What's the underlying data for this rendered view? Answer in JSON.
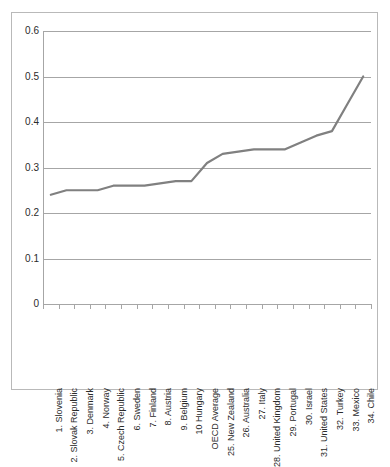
{
  "chart_data": {
    "type": "line",
    "title": "",
    "subtitle": "",
    "xlabel": "",
    "ylabel": "",
    "ylim": [
      0,
      0.6
    ],
    "y_ticks": [
      0,
      0.1,
      0.2,
      0.3,
      0.4,
      0.5,
      0.6
    ],
    "y_tick_labels": [
      "0",
      "0.1",
      "0.2",
      "0.3",
      "0.4",
      "0.5",
      "0.6"
    ],
    "grid": true,
    "legend": false,
    "legend_position": "none",
    "line_color": "#808080",
    "gridline_color": "#a6a6a6",
    "background_color": "#ffffff",
    "border_color": "#b9b9b9",
    "categories": [
      "1. Slovenia",
      "2. Slovak Republic",
      "3. Denmark",
      "4. Norway",
      "5. Czech Republic",
      "6. Sweden",
      "7. Finland",
      "8. Austria",
      "9. Belgium",
      "10 Hungary",
      "OECD Average",
      "25. New Zealand",
      "26. Australia",
      "27. Italy",
      "28. United Kingdom",
      "29. Portugal",
      "30. Israel",
      "31. United States",
      "32. Turkey",
      "33. Mexico",
      "34. Chile"
    ],
    "values": [
      0.24,
      0.25,
      0.25,
      0.25,
      0.26,
      0.26,
      0.26,
      0.265,
      0.27,
      0.27,
      0.31,
      0.33,
      0.335,
      0.34,
      0.34,
      0.34,
      0.355,
      0.37,
      0.38,
      0.44,
      0.5
    ],
    "series": [
      {
        "name": "",
        "values": [
          0.24,
          0.25,
          0.25,
          0.25,
          0.26,
          0.26,
          0.26,
          0.265,
          0.27,
          0.27,
          0.31,
          0.33,
          0.335,
          0.34,
          0.34,
          0.34,
          0.355,
          0.37,
          0.38,
          0.44,
          0.5
        ]
      }
    ]
  }
}
